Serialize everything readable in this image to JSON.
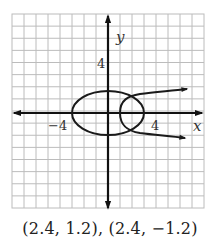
{
  "graph": {
    "x_axis_label": "x",
    "y_axis_label": "y",
    "tick_labels": {
      "x_negative": "−4",
      "x_positive": "4",
      "y_positive": "4"
    },
    "grid": {
      "x_min": -8,
      "x_max": 8,
      "y_min": -8,
      "y_max": 8,
      "step": 1
    },
    "colors": {
      "grid": "#b8b8b8",
      "axis": "#111111",
      "curve": "#1a1a1a"
    },
    "curves": [
      {
        "name": "ellipse",
        "description": "Ellipse centered at origin, x-intercepts ±3, y-intercepts ±2"
      },
      {
        "name": "parabola",
        "description": "Parabola opening right, vertex (1, 0)"
      }
    ]
  },
  "caption": "(2.4, 1.2), (2.4, −1.2)"
}
